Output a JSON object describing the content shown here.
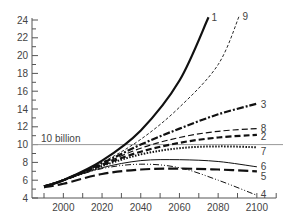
{
  "chart_data": {
    "type": "line",
    "title": "",
    "xlabel": "",
    "ylabel": "",
    "xlim": [
      1990,
      2110
    ],
    "ylim": [
      4,
      24
    ],
    "x_ticks": [
      2000,
      2020,
      2040,
      2060,
      2080,
      2100
    ],
    "y_ticks": [
      4,
      6,
      8,
      10,
      12,
      14,
      16,
      18,
      20,
      22,
      24
    ],
    "grid": false,
    "legend": "inline labels at line ends",
    "reference_line": {
      "y": 10,
      "label": "10 billion",
      "color": "#999999"
    },
    "x": [
      1990,
      2000,
      2020,
      2040,
      2060,
      2080,
      2100
    ],
    "series": [
      {
        "name": "1",
        "style": "solid-thick",
        "values": [
          5.3,
          6.0,
          8.2,
          11.6,
          17.2,
          null,
          null
        ],
        "end": [
          2075,
          24.3
        ]
      },
      {
        "name": "9",
        "style": "dashed-thin",
        "values": [
          5.3,
          6.0,
          8.0,
          10.6,
          14.2,
          19.0,
          null
        ],
        "end": [
          2091,
          24.5
        ]
      },
      {
        "name": "3",
        "style": "dash-dot-thick",
        "values": [
          5.3,
          6.0,
          7.9,
          10.0,
          11.8,
          13.4,
          14.6
        ]
      },
      {
        "name": "8",
        "style": "dashed-medium",
        "values": [
          5.3,
          6.0,
          7.8,
          9.6,
          10.8,
          11.5,
          11.8
        ]
      },
      {
        "name": "2",
        "style": "dashed-thick",
        "values": [
          5.3,
          6.0,
          7.7,
          9.2,
          10.2,
          10.8,
          11.1
        ]
      },
      {
        "name": "7",
        "style": "dotted-thick",
        "values": [
          5.3,
          6.0,
          7.6,
          8.9,
          9.6,
          9.8,
          9.7
        ]
      },
      {
        "name": "6",
        "style": "solid-thin",
        "values": [
          5.3,
          6.0,
          7.4,
          8.2,
          8.3,
          8.1,
          7.5
        ]
      },
      {
        "name": "5",
        "style": "long-dash-thick",
        "values": [
          5.2,
          5.6,
          6.7,
          7.2,
          7.3,
          7.2,
          7.0
        ]
      },
      {
        "name": "4",
        "style": "dash-dot-dot-thin",
        "values": [
          5.3,
          6.0,
          7.3,
          7.8,
          7.4,
          6.0,
          4.3
        ]
      }
    ]
  }
}
